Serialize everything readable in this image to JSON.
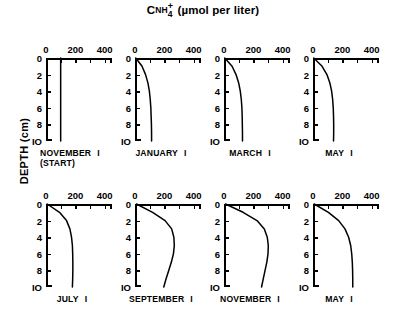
{
  "chart_data": {
    "type": "line",
    "title_parts": {
      "c": "C",
      "sub_nh": "NH",
      "sub_4": "4",
      "sup_plus": "+",
      "units": "(µmol per liter)"
    },
    "xlabel": "",
    "ylabel": "DEPTH (cm)",
    "xlim": [
      0,
      450
    ],
    "ylim": [
      0,
      10
    ],
    "y_inverted": true,
    "grid": false,
    "legend": "none",
    "x_ticks_major": [
      0,
      200,
      400
    ],
    "x_ticks_minor": [
      100,
      300
    ],
    "x_tick_labels": [
      "0",
      "200",
      "400"
    ],
    "y_ticks": [
      0,
      2,
      4,
      6,
      8,
      10
    ],
    "y_tick_labels": [
      "0",
      "2",
      "4",
      "6",
      "8",
      "IO"
    ],
    "panel_label_tick": "I",
    "panels": [
      {
        "label": "NOVEMBER",
        "sublabel": "(START)",
        "row": 0,
        "col": 0,
        "depths": [
          0,
          1,
          2,
          3,
          4,
          5,
          6,
          7,
          8,
          9,
          10
        ],
        "values": [
          100,
          100,
          100,
          100,
          100,
          100,
          100,
          100,
          100,
          100,
          100
        ]
      },
      {
        "label": "JANUARY",
        "sublabel": "",
        "row": 0,
        "col": 1,
        "depths": [
          0,
          1,
          2,
          3,
          4,
          5,
          6,
          7,
          8,
          9,
          10
        ],
        "values": [
          5,
          48,
          72,
          88,
          98,
          104,
          108,
          110,
          112,
          113,
          113
        ]
      },
      {
        "label": "MARCH",
        "sublabel": "",
        "row": 0,
        "col": 2,
        "depths": [
          0,
          1,
          2,
          3,
          4,
          5,
          6,
          7,
          8,
          9,
          10
        ],
        "values": [
          5,
          55,
          82,
          100,
          111,
          118,
          122,
          124,
          125,
          126,
          126
        ]
      },
      {
        "label": "MAY",
        "sublabel": "",
        "row": 0,
        "col": 3,
        "depths": [
          0,
          1,
          2,
          3,
          4,
          5,
          6,
          7,
          8,
          9,
          10
        ],
        "values": [
          5,
          62,
          95,
          115,
          127,
          134,
          138,
          140,
          141,
          141,
          140
        ]
      },
      {
        "label": "JULY",
        "sublabel": "",
        "row": 1,
        "col": 0,
        "depths": [
          0,
          1,
          2,
          3,
          4,
          5,
          6,
          7,
          8,
          9,
          10
        ],
        "values": [
          8,
          92,
          140,
          163,
          174,
          180,
          182,
          183,
          183,
          182,
          180
        ]
      },
      {
        "label": "SEPTEMBER",
        "sublabel": "",
        "row": 1,
        "col": 1,
        "depths": [
          0,
          1,
          2,
          3,
          4,
          5,
          6,
          7,
          8,
          9,
          10
        ],
        "values": [
          10,
          120,
          205,
          250,
          265,
          268,
          262,
          248,
          230,
          212,
          196
        ]
      },
      {
        "label": "NOVEMBER",
        "sublabel": "",
        "row": 1,
        "col": 2,
        "depths": [
          0,
          1,
          2,
          3,
          4,
          5,
          6,
          7,
          8,
          9,
          10
        ],
        "values": [
          10,
          130,
          225,
          275,
          295,
          302,
          300,
          292,
          280,
          268,
          256
        ]
      },
      {
        "label": "MAY",
        "sublabel": "",
        "row": 1,
        "col": 3,
        "depths": [
          0,
          1,
          2,
          3,
          4,
          5,
          6,
          7,
          8,
          9,
          10
        ],
        "values": [
          8,
          105,
          175,
          218,
          243,
          257,
          264,
          268,
          270,
          271,
          271
        ]
      }
    ]
  }
}
